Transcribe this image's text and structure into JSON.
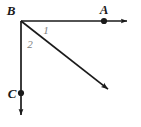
{
  "figure": {
    "kind": "geometry-diagram",
    "background_color": "#ffffff",
    "line_color": "#1a1a1a",
    "angle_label_color": "#7d7d7d",
    "width": 141,
    "height": 127
  },
  "points": {
    "vertex": {
      "name": "B",
      "label": "B",
      "x": 21,
      "y": 21,
      "label_x": 11,
      "label_y": 15,
      "has_dot": false
    },
    "a": {
      "name": "A",
      "label": "A",
      "x": 104,
      "y": 21,
      "label_x": 104,
      "label_y": 14,
      "has_dot": true
    },
    "c": {
      "name": "C",
      "label": "C",
      "x": 21,
      "y": 93,
      "label_x": 12,
      "label_y": 98,
      "has_dot": true
    }
  },
  "rays": [
    {
      "name": "ray-BA",
      "label": "BA",
      "from_x": 21,
      "from_y": 21,
      "to_x": 134,
      "to_y": 21,
      "direction": "right",
      "arrowhead": true
    },
    {
      "name": "ray-BC",
      "label": "BC",
      "from_x": 21,
      "from_y": 21,
      "to_x": 21,
      "to_y": 122,
      "direction": "down",
      "arrowhead": true
    },
    {
      "name": "ray-B-diagonal",
      "label": "BD",
      "from_x": 21,
      "from_y": 21,
      "to_x": 114,
      "to_y": 94,
      "direction": "down-right",
      "arrowhead": true
    }
  ],
  "angles": [
    {
      "name": "angle-1",
      "label": "1",
      "x": 46,
      "y": 34,
      "between": "ray-BA and ray-B-diagonal"
    },
    {
      "name": "angle-2",
      "label": "2",
      "x": 29,
      "y": 48,
      "between": "ray-B-diagonal and ray-BC"
    }
  ]
}
